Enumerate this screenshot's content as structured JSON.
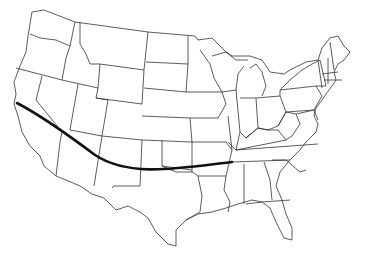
{
  "map": {
    "type": "outline-map",
    "region": "Contiguous United States",
    "width": 378,
    "height": 260,
    "background": "#ffffff",
    "state_fill": "#ffffff",
    "state_stroke": "#333333"
  },
  "route": {
    "description": "Curved route from San Francisco, California across Arizona, New Mexico and the Texas panhandle to Memphis, Tennessee",
    "color": "#111111",
    "stroke_width": 2.6,
    "start_label": "",
    "end_label": "",
    "path": "M17,103 C40,115 75,140 95,155 C130,178 180,168 232,162"
  }
}
